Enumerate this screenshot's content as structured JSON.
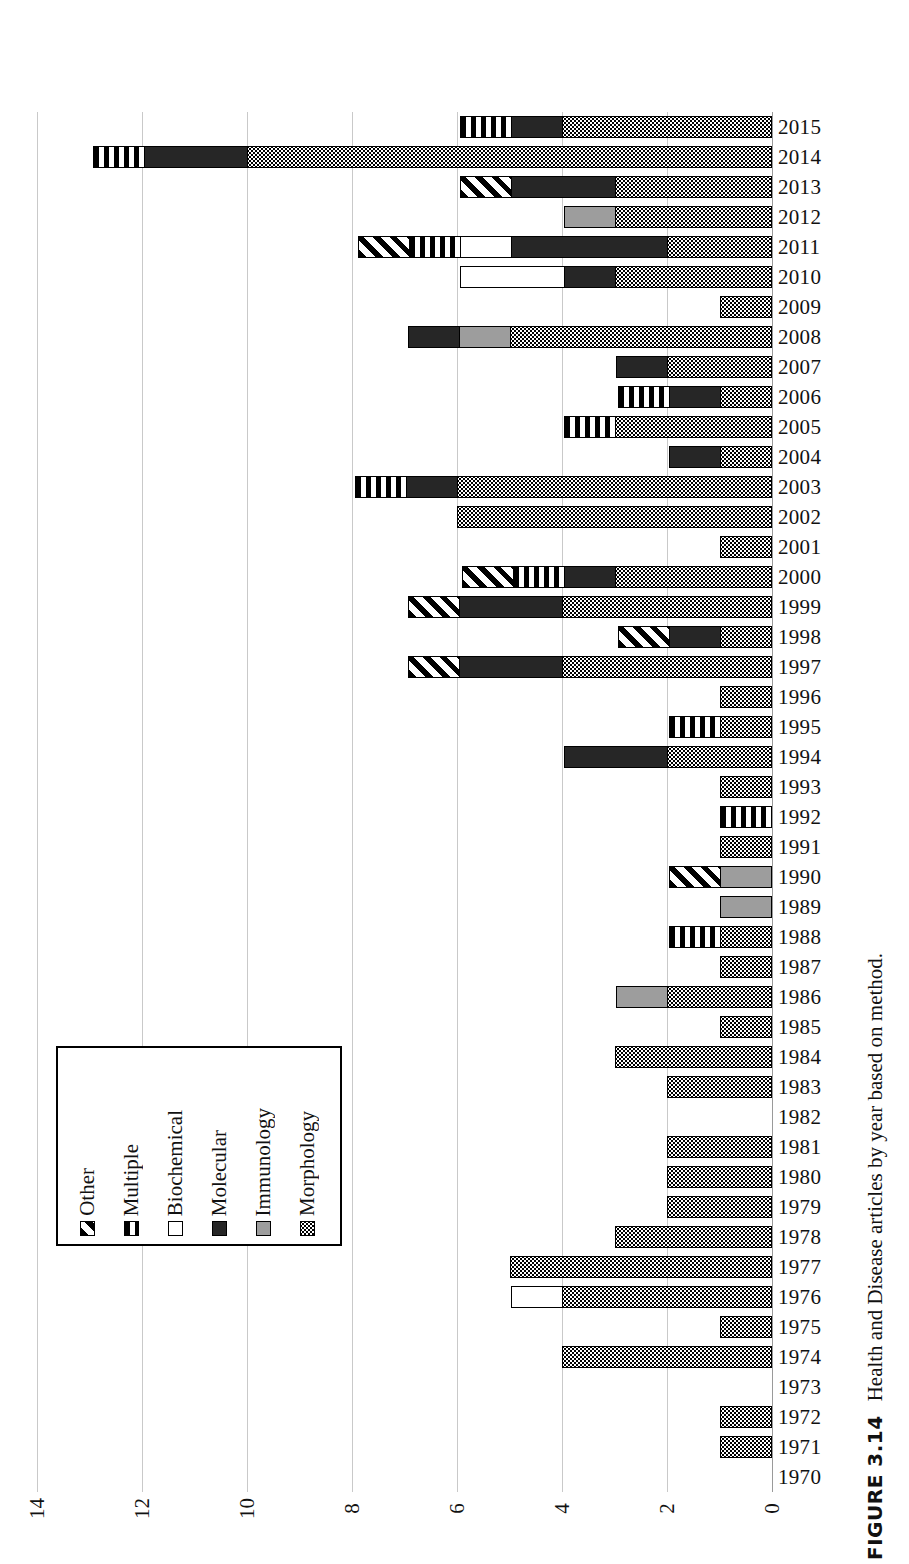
{
  "figure": {
    "number_label": "FIGURE 3.14",
    "caption": "Health and Disease articles by year based on method."
  },
  "legend": {
    "items": [
      {
        "label": "Other",
        "pattern": "diagonal-hatch",
        "color": "#000000"
      },
      {
        "label": "Multiple",
        "pattern": "vertical-stripe",
        "color": "#000000"
      },
      {
        "label": "Biochemical",
        "pattern": "solid-white",
        "color": "#ffffff"
      },
      {
        "label": "Molecular",
        "pattern": "solid-black",
        "color": "#262626"
      },
      {
        "label": "Immunology",
        "pattern": "solid-gray",
        "color": "#9d9d9d"
      },
      {
        "label": "Morphology",
        "pattern": "dotted",
        "color": "#000000"
      }
    ]
  },
  "axis": {
    "value_ticks": [
      "14",
      "12",
      "10",
      "8",
      "6",
      "4",
      "2",
      "0"
    ],
    "value_min": 0,
    "value_max": 14,
    "value_step": 2,
    "direction": "right-to-left",
    "category_axis": "year"
  },
  "chart_data": {
    "type": "bar",
    "orientation": "horizontal-stacked",
    "title": "Health and Disease articles by year based on method.",
    "xlabel": "",
    "ylabel": "",
    "xlim": [
      0,
      14
    ],
    "grid": true,
    "legend_position": "inside-lower-left",
    "categories": [
      "2015",
      "2014",
      "2013",
      "2012",
      "2011",
      "2010",
      "2009",
      "2008",
      "2007",
      "2006",
      "2005",
      "2004",
      "2003",
      "2002",
      "2001",
      "2000",
      "1999",
      "1998",
      "1997",
      "1996",
      "1995",
      "1994",
      "1993",
      "1992",
      "1991",
      "1990",
      "1989",
      "1988",
      "1987",
      "1986",
      "1985",
      "1984",
      "1983",
      "1982",
      "1981",
      "1980",
      "1979",
      "1978",
      "1977",
      "1976",
      "1975",
      "1974",
      "1973",
      "1972",
      "1971",
      "1970"
    ],
    "series": [
      {
        "name": "Other",
        "values": [
          0,
          0,
          1,
          0,
          1,
          0,
          0,
          0,
          0,
          0,
          0,
          0,
          0,
          0,
          0,
          1,
          1,
          1,
          1,
          0,
          0,
          0,
          0,
          0,
          0,
          1,
          0,
          0,
          0,
          0,
          0,
          0,
          0,
          0,
          0,
          0,
          0,
          0,
          0,
          0,
          0,
          0,
          0,
          0,
          0,
          0
        ]
      },
      {
        "name": "Multiple",
        "values": [
          1,
          1,
          0,
          0,
          1,
          0,
          0,
          0,
          0,
          1,
          1,
          0,
          1,
          0,
          0,
          1,
          0,
          0,
          0,
          0,
          1,
          0,
          0,
          1,
          0,
          0,
          0,
          1,
          0,
          0,
          0,
          0,
          0,
          0,
          0,
          0,
          0,
          0,
          0,
          0,
          0,
          0,
          0,
          0,
          0,
          0
        ]
      },
      {
        "name": "Biochemical",
        "values": [
          0,
          0,
          0,
          0,
          1,
          2,
          0,
          0,
          0,
          0,
          0,
          0,
          0,
          0,
          0,
          0,
          0,
          0,
          0,
          0,
          0,
          0,
          0,
          0,
          0,
          0,
          0,
          0,
          0,
          0,
          0,
          0,
          0,
          0,
          0,
          0,
          0,
          0,
          0,
          1,
          0,
          0,
          0,
          0,
          0,
          0
        ]
      },
      {
        "name": "Molecular",
        "values": [
          1,
          2,
          2,
          0,
          3,
          1,
          0,
          1,
          1,
          1,
          0,
          1,
          1,
          0,
          0,
          1,
          2,
          1,
          2,
          0,
          0,
          2,
          0,
          0,
          0,
          0,
          0,
          0,
          0,
          0,
          0,
          0,
          0,
          0,
          0,
          0,
          0,
          0,
          0,
          0,
          0,
          0,
          0,
          0,
          0,
          0
        ]
      },
      {
        "name": "Immunology",
        "values": [
          0,
          0,
          0,
          1,
          0,
          0,
          0,
          1,
          0,
          0,
          0,
          0,
          0,
          0,
          0,
          0,
          0,
          0,
          0,
          0,
          0,
          0,
          0,
          0,
          0,
          1,
          1,
          0,
          0,
          1,
          0,
          0,
          0,
          0,
          0,
          0,
          0,
          0,
          0,
          0,
          0,
          0,
          0,
          0,
          0,
          0
        ]
      },
      {
        "name": "Morphology",
        "values": [
          4,
          10,
          3,
          3,
          2,
          3,
          1,
          5,
          2,
          1,
          3,
          1,
          6,
          6,
          1,
          3,
          4,
          1,
          4,
          1,
          1,
          2,
          1,
          0,
          1,
          0,
          0,
          1,
          1,
          2,
          1,
          3,
          2,
          0,
          2,
          2,
          2,
          3,
          5,
          4,
          1,
          4,
          0,
          1,
          1,
          0
        ]
      }
    ],
    "totals": [
      6,
      13,
      6,
      4,
      8,
      6,
      1,
      7,
      3,
      3,
      4,
      2,
      8,
      6,
      1,
      6,
      7,
      3,
      7,
      1,
      2,
      4,
      1,
      1,
      1,
      2,
      1,
      2,
      1,
      3,
      1,
      3,
      2,
      0,
      2,
      2,
      2,
      3,
      5,
      5,
      1,
      4,
      0,
      1,
      1,
      0
    ]
  }
}
